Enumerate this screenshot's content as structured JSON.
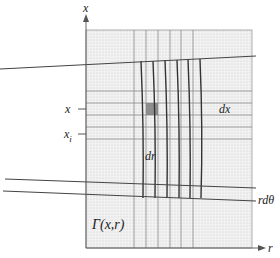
{
  "diagram": {
    "type": "coordinate-grid-figure",
    "axes": {
      "vertical": {
        "label": "x"
      },
      "horizontal": {
        "label": "r"
      }
    },
    "labels": {
      "x_tick": "x",
      "xi_tick_base": "x",
      "xi_tick_sub": "i",
      "dx": "dx",
      "dr": "dr",
      "rdtheta": "rdθ",
      "region": "Γ(x,r)"
    },
    "colors": {
      "region_fill": "#efefef",
      "region_dots": "#c9c9c9",
      "highlight_cell": "#7a7a7a",
      "lines": "#444444"
    },
    "region": {
      "x": 86,
      "y": 30,
      "w": 166,
      "h": 218
    },
    "vertical_grid_x": [
      134,
      146,
      158,
      170,
      181,
      193
    ],
    "horizontal_grid_y": [
      91,
      103,
      115,
      127,
      139
    ],
    "highlight_cell": {
      "x": 146,
      "y": 103,
      "w": 12,
      "h": 12
    }
  }
}
